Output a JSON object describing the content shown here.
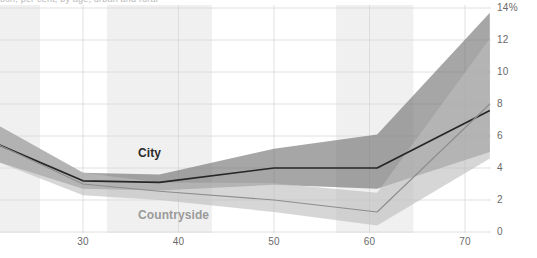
{
  "figure": {
    "clipped_title": "tion, per cent, by age, urban and rural"
  },
  "chart_data": {
    "type": "area",
    "title": "",
    "subtitle": "",
    "xlabel": "",
    "ylabel": "",
    "xlim": [
      21.0,
      72.6
    ],
    "ylim": [
      0,
      14
    ],
    "grid": true,
    "legend_position": "inline-annotations",
    "x_ticks": [
      30,
      40,
      50,
      60,
      70
    ],
    "x_tick_labels": [
      "30",
      "40",
      "50",
      "60",
      "70"
    ],
    "y_ticks": [
      0,
      2,
      4,
      6,
      8,
      10,
      12,
      14
    ],
    "y_tick_labels": [
      "0",
      "2",
      "4",
      "6",
      "8",
      "10",
      "12",
      "14%"
    ],
    "y_unit": "%",
    "shaded_bands": [
      {
        "x0": 21.0,
        "x1": 25.5
      },
      {
        "x0": 32.5,
        "x1": 43.5
      },
      {
        "x0": 56.5,
        "x1": 64.6
      }
    ],
    "series": [
      {
        "name": "City",
        "color": "#6f6f6f",
        "line_color": "#262626",
        "x": [
          21.0,
          30.0,
          38.0,
          50.0,
          60.8,
          72.6
        ],
        "values": [
          5.5,
          3.2,
          3.1,
          4.0,
          4.0,
          7.6
        ],
        "band_upper": [
          6.7,
          3.7,
          3.6,
          5.2,
          6.1,
          13.7
        ],
        "band_lower": [
          4.4,
          2.7,
          2.6,
          2.95,
          2.7,
          5.0
        ]
      },
      {
        "name": "Countryside",
        "color": "#bdbdbd",
        "line_color": "#8d8d8d",
        "x": [
          21.0,
          30.0,
          38.0,
          50.0,
          60.8,
          72.6
        ],
        "values": [
          5.5,
          3.0,
          2.55,
          2.0,
          1.25,
          8.0
        ],
        "band_upper": [
          6.7,
          3.7,
          3.1,
          3.05,
          2.45,
          12.1
        ],
        "band_lower": [
          4.4,
          2.3,
          2.0,
          1.25,
          0.4,
          4.6
        ]
      }
    ]
  },
  "annotations": [
    {
      "id": "city",
      "text": "City"
    },
    {
      "id": "countryside",
      "text": "Countryside"
    }
  ]
}
